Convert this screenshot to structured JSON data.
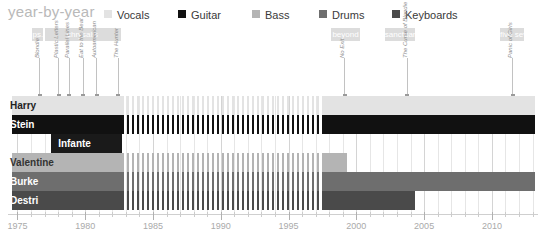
{
  "header": {
    "title": "year-by-year"
  },
  "legend": {
    "items": [
      {
        "label": "Vocals",
        "color": "#e3e3e3",
        "x": 0
      },
      {
        "label": "Guitar",
        "color": "#111111",
        "x": 74
      },
      {
        "label": "Bass",
        "color": "#b4b4b4",
        "x": 148
      },
      {
        "label": "Drums",
        "color": "#6e6e6e",
        "x": 215
      },
      {
        "label": "Keyboards",
        "color": "#4a4a4a",
        "x": 288
      }
    ]
  },
  "record_labels": [
    {
      "name": "ps.",
      "start": 1976.1,
      "end": 1976.9
    },
    {
      "name": "chrysalis",
      "start": 1977.0,
      "end": 1982.6
    },
    {
      "name": "beyond",
      "start": 1998.1,
      "end": 2000.3
    },
    {
      "name": "sanctuary",
      "start": 2002.1,
      "end": 2004.3
    },
    {
      "name": "five seven",
      "start": 2010.6,
      "end": 2012.4
    }
  ],
  "albums": [
    {
      "title": "Blondie",
      "year": 1976.6
    },
    {
      "title": "Plastic Letters",
      "year": 1978.0
    },
    {
      "title": "Parallel Lines",
      "year": 1978.8
    },
    {
      "title": "Eat to the Beat",
      "year": 1979.8
    },
    {
      "title": "Autoamerican",
      "year": 1980.8
    },
    {
      "title": "The Hunter",
      "year": 1982.4
    },
    {
      "title": "No Exit",
      "year": 1999.1
    },
    {
      "title": "The Curse of Blondie",
      "year": 2003.7
    },
    {
      "title": "Panic of Girls",
      "year": 2011.5
    }
  ],
  "members": [
    {
      "name": "Harry",
      "role": "Vocals",
      "color": "#e3e3e3",
      "text_color": "#222222",
      "segments": [
        {
          "start": 1974.6,
          "end": 1982.7,
          "style": "solid"
        },
        {
          "start": 1982.7,
          "end": 1997.6,
          "style": "hatched"
        },
        {
          "start": 1997.6,
          "end": 2013.2,
          "style": "solid"
        }
      ]
    },
    {
      "name": "Stein",
      "role": "Guitar",
      "color": "#111111",
      "text_color": "#ffffff",
      "segments": [
        {
          "start": 1974.6,
          "end": 1982.7,
          "style": "solid"
        },
        {
          "start": 1982.7,
          "end": 1997.6,
          "style": "hatched"
        },
        {
          "start": 1997.6,
          "end": 2013.2,
          "style": "solid"
        }
      ]
    },
    {
      "name": "Infante",
      "role": "Guitar",
      "color": "#1a1a1a",
      "text_color": "#ffffff",
      "segments": [
        {
          "start": 1977.5,
          "end": 1982.7,
          "style": "solid"
        }
      ]
    },
    {
      "name": "Valentine",
      "role": "Bass",
      "color": "#b4b4b4",
      "text_color": "#333333",
      "segments": [
        {
          "start": 1974.6,
          "end": 1982.7,
          "style": "solid"
        },
        {
          "start": 1982.7,
          "end": 1997.6,
          "style": "hatched"
        },
        {
          "start": 1997.6,
          "end": 1999.3,
          "style": "solid"
        }
      ]
    },
    {
      "name": "Burke",
      "role": "Drums",
      "color": "#6e6e6e",
      "text_color": "#ffffff",
      "segments": [
        {
          "start": 1974.6,
          "end": 1982.7,
          "style": "solid"
        },
        {
          "start": 1982.7,
          "end": 1997.6,
          "style": "hatched"
        },
        {
          "start": 1997.6,
          "end": 2013.2,
          "style": "solid"
        }
      ]
    },
    {
      "name": "Destri",
      "role": "Keyboards",
      "color": "#4a4a4a",
      "text_color": "#ffffff",
      "segments": [
        {
          "start": 1974.6,
          "end": 1982.7,
          "style": "solid"
        },
        {
          "start": 1982.7,
          "end": 1997.6,
          "style": "hatched"
        },
        {
          "start": 1997.6,
          "end": 2004.3,
          "style": "solid"
        }
      ]
    }
  ],
  "axis": {
    "min": 1974.3,
    "max": 2013.4,
    "major_ticks": [
      1975,
      1980,
      1985,
      1990,
      1995,
      2000,
      2005,
      2010
    ],
    "major_labels": [
      "1975",
      "1980",
      "1985",
      "1990",
      "1995",
      "2000",
      "2005",
      "2010"
    ],
    "minor_step": 1
  },
  "chart_data": {
    "type": "bar",
    "title": "year-by-year",
    "xlabel": "",
    "ylabel": "",
    "xlim": [
      1974.3,
      2013.4
    ],
    "grid": true,
    "legend_position": "top",
    "categories": [
      "Harry",
      "Stein",
      "Infante",
      "Valentine",
      "Burke",
      "Destri"
    ],
    "series": [
      {
        "name": "Harry",
        "role": "Vocals",
        "active": [
          [
            1974.6,
            1982.7
          ],
          [
            1997.6,
            2013.2
          ]
        ],
        "hiatus": [
          [
            1982.7,
            1997.6
          ]
        ]
      },
      {
        "name": "Stein",
        "role": "Guitar",
        "active": [
          [
            1974.6,
            1982.7
          ],
          [
            1997.6,
            2013.2
          ]
        ],
        "hiatus": [
          [
            1982.7,
            1997.6
          ]
        ]
      },
      {
        "name": "Infante",
        "role": "Guitar",
        "active": [
          [
            1977.5,
            1982.7
          ]
        ],
        "hiatus": []
      },
      {
        "name": "Valentine",
        "role": "Bass",
        "active": [
          [
            1974.6,
            1982.7
          ],
          [
            1997.6,
            1999.3
          ]
        ],
        "hiatus": [
          [
            1982.7,
            1997.6
          ]
        ]
      },
      {
        "name": "Burke",
        "role": "Drums",
        "active": [
          [
            1974.6,
            1982.7
          ],
          [
            1997.6,
            2013.2
          ]
        ],
        "hiatus": [
          [
            1982.7,
            1997.6
          ]
        ]
      },
      {
        "name": "Destri",
        "role": "Keyboards",
        "active": [
          [
            1974.6,
            1982.7
          ],
          [
            1997.6,
            2004.3
          ]
        ],
        "hiatus": [
          [
            1982.7,
            1997.6
          ]
        ]
      }
    ],
    "annotations": {
      "albums": [
        "Blondie",
        "Plastic Letters",
        "Parallel Lines",
        "Eat to the Beat",
        "Autoamerican",
        "The Hunter",
        "No Exit",
        "The Curse of Blondie",
        "Panic of Girls"
      ],
      "album_years": [
        1976.6,
        1978.0,
        1978.8,
        1979.8,
        1980.8,
        1982.4,
        1999.1,
        2003.7,
        2011.5
      ],
      "record_labels": [
        "ps.",
        "chrysalis",
        "beyond",
        "sanctuary",
        "five seven"
      ]
    }
  }
}
